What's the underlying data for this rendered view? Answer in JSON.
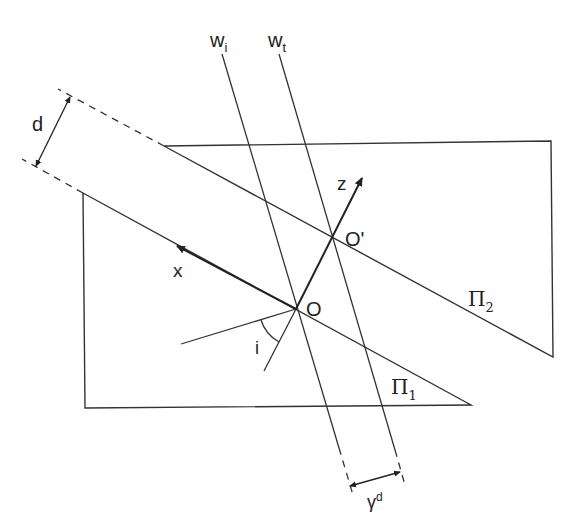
{
  "diagram": {
    "type": "geometric-optics",
    "labels": {
      "w_i_base": "w",
      "w_i_sub": "i",
      "w_t_base": "w",
      "w_t_sub": "t",
      "d": "d",
      "z": "z",
      "x": "x",
      "O": "O",
      "O_prime": "O'",
      "pi2_base": "Π",
      "pi2_sub": "2",
      "pi1_base": "Π",
      "pi1_sub": "1",
      "angle_i": "i",
      "gamma_base": "γ",
      "gamma_sup": "d"
    },
    "colors": {
      "stroke": "#333333",
      "background": "#ffffff"
    },
    "elements": [
      {
        "id": "plane-pi1",
        "desc": "lower plane Π1"
      },
      {
        "id": "plane-pi2",
        "desc": "upper plane Π2"
      },
      {
        "id": "ray-wi",
        "desc": "incident ray w_i"
      },
      {
        "id": "ray-wt",
        "desc": "transmitted ray w_t"
      },
      {
        "id": "axis-x",
        "desc": "x axis from O"
      },
      {
        "id": "axis-z",
        "desc": "z axis from O through O'"
      },
      {
        "id": "dimension-d",
        "desc": "separation d between planes"
      },
      {
        "id": "dimension-gamma-d",
        "desc": "lateral shift γ^d"
      },
      {
        "id": "angle-i",
        "desc": "angle of incidence i"
      }
    ]
  }
}
